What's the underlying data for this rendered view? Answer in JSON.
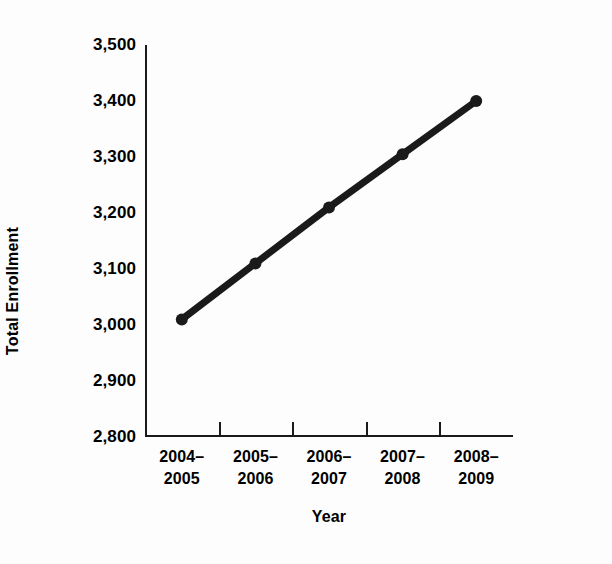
{
  "chart_data": {
    "type": "line",
    "title": "",
    "xlabel": "Year",
    "ylabel": "Total Enrollment",
    "categories": [
      "2004–2005",
      "2005–2006",
      "2006–2007",
      "2007–2008",
      "2008–2009"
    ],
    "category_lines": [
      [
        "2004–",
        "2005"
      ],
      [
        "2005–",
        "2006"
      ],
      [
        "2006–",
        "2007"
      ],
      [
        "2007–",
        "2008"
      ],
      [
        "2008–",
        "2009"
      ]
    ],
    "values": [
      3010,
      3110,
      3210,
      3305,
      3400
    ],
    "value_labels": [
      "3,010",
      "3,110",
      "3,210",
      "3,305",
      "3,400"
    ],
    "ylim": [
      2800,
      3500
    ],
    "yticks": [
      2800,
      2900,
      3000,
      3100,
      3200,
      3300,
      3400,
      3500
    ],
    "ytick_labels": [
      "2,800",
      "2,900",
      "3,000",
      "3,100",
      "3,200",
      "3,300",
      "3,400",
      "3,500"
    ],
    "grid": false,
    "legend": false,
    "legend_position": "none",
    "marker": "circle",
    "line_color": "#1a1a1a",
    "marker_color": "#1a1a1a",
    "background_color": "#fdfdfd",
    "axis_color": "#1a1a1a",
    "text_color": "#000000"
  }
}
